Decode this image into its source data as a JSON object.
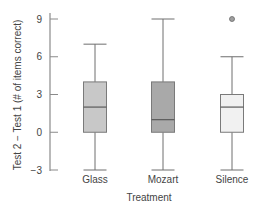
{
  "chart_data": {
    "type": "box",
    "title": "",
    "xlabel": "Treatment",
    "ylabel": "Test 2 − Test 1 (# of items correct)",
    "ylim": [
      -3,
      9
    ],
    "yticks": [
      9,
      6,
      3,
      0,
      -3
    ],
    "ytick_labels": [
      "9",
      "6",
      "3",
      "0",
      "−3"
    ],
    "grid": false,
    "legend": null,
    "categories": [
      "Glass",
      "Mozart",
      "Silence"
    ],
    "series": [
      {
        "name": "Glass",
        "whisker_low": -3,
        "q1": 0,
        "median": 2,
        "q3": 4,
        "whisker_high": 7,
        "outliers": [],
        "color": "#c8c8c8"
      },
      {
        "name": "Mozart",
        "whisker_low": -3,
        "q1": 0,
        "median": 1,
        "q3": 4,
        "whisker_high": 9,
        "outliers": [],
        "color": "#a9a9a9"
      },
      {
        "name": "Silence",
        "whisker_low": -3,
        "q1": 0,
        "median": 2,
        "q3": 3,
        "whisker_high": 6,
        "outliers": [
          9
        ],
        "color": "#f1f1f1"
      }
    ]
  },
  "colors": {
    "axis": "#8a8a8a",
    "box_stroke": "#7a7a7a",
    "whisker": "#6e6e6e",
    "outlier_fill": "#a0a0a0",
    "text": "#444444"
  }
}
